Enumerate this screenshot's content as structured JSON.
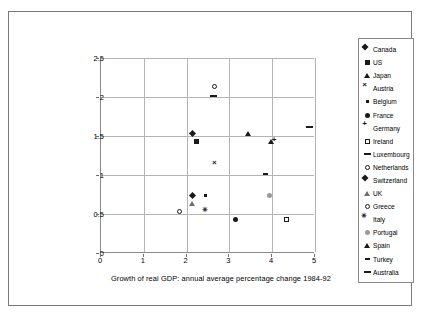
{
  "chart_data": {
    "type": "scatter",
    "title": "",
    "xlabel": "Growth of real GDP: annual average percentage change 1984-92",
    "ylabel_line1": "Employment growth: annual average percentage change",
    "ylabel_line2": "1984-92",
    "xlim": [
      0,
      5
    ],
    "ylim": [
      0,
      2.5
    ],
    "xticks": [
      "0",
      "1",
      "2",
      "3",
      "4",
      "5"
    ],
    "yticks": [
      "0",
      "0.5",
      "1",
      "1.5",
      "2",
      "2.5"
    ],
    "grid": true,
    "legend_position": "right",
    "series": [
      {
        "name": "Canada",
        "marker": "diamond-filled",
        "x": 2.2,
        "y": 1.5
      },
      {
        "name": "US",
        "marker": "square-filled",
        "x": 2.3,
        "y": 1.4
      },
      {
        "name": "Japan",
        "marker": "triangle-filled",
        "x": 3.5,
        "y": 1.5
      },
      {
        "name": "Austria",
        "marker": "x-cross",
        "x": 2.7,
        "y": 1.1
      },
      {
        "name": "Belgium",
        "marker": "square-grid",
        "x": 2.5,
        "y": 0.7
      },
      {
        "name": "France",
        "marker": "circle-filled",
        "x": 3.2,
        "y": 0.4
      },
      {
        "name": "Germany",
        "marker": "plus",
        "x": 4.1,
        "y": 1.4
      },
      {
        "name": "Ireland",
        "marker": "square-open",
        "x": 4.4,
        "y": 0.4
      },
      {
        "name": "Luxembourg",
        "marker": "dash",
        "x": 2.7,
        "y": 2.0
      },
      {
        "name": "Netherlands",
        "marker": "circle-open",
        "x": 2.7,
        "y": 2.1
      },
      {
        "name": "Switzerland",
        "marker": "diamond-filled",
        "x": 2.2,
        "y": 0.7
      },
      {
        "name": "UK",
        "marker": "triangle-open",
        "x": 2.2,
        "y": 0.6
      },
      {
        "name": "Greece",
        "marker": "circle-open",
        "x": 1.9,
        "y": 0.5
      },
      {
        "name": "Italy",
        "marker": "asterisk",
        "x": 2.5,
        "y": 0.5
      },
      {
        "name": "Portugal",
        "marker": "circle-gray",
        "x": 4.0,
        "y": 0.7
      },
      {
        "name": "Spain",
        "marker": "triangle-filled",
        "x": 4.05,
        "y": 1.4
      },
      {
        "name": "Turkey",
        "marker": "dash-small",
        "x": 3.9,
        "y": 1.0
      },
      {
        "name": "Australia",
        "marker": "dash",
        "x": 4.95,
        "y": 1.6
      }
    ]
  }
}
